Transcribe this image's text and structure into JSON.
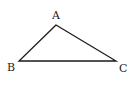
{
  "diagram": {
    "type": "triangle",
    "stroke_color": "#1a1a1a",
    "vertices": [
      {
        "name": "A",
        "x": 56,
        "y": 25,
        "label": "A",
        "label_x": 52,
        "label_y": 19
      },
      {
        "name": "B",
        "x": 19,
        "y": 61,
        "label": "B",
        "label_x": 7,
        "label_y": 71
      },
      {
        "name": "C",
        "x": 116,
        "y": 61,
        "label": "C",
        "label_x": 119,
        "label_y": 72
      }
    ],
    "edges": [
      [
        "A",
        "B"
      ],
      [
        "B",
        "C"
      ],
      [
        "C",
        "A"
      ]
    ]
  }
}
